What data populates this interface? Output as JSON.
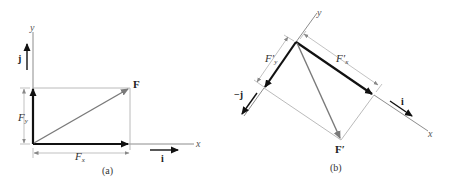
{
  "figure_a": {
    "caption": "(a)",
    "axis_x_label": "x",
    "axis_y_label": "y",
    "force_label": "F",
    "component_x_label": "F",
    "component_x_sub": "x",
    "component_y_label": "F",
    "component_y_sub": "y",
    "unit_i_label": "i",
    "unit_j_label": "j"
  },
  "figure_b": {
    "caption": "(b)",
    "axis_x_label": "x",
    "axis_y_label": "y",
    "force_label": "F′",
    "component_x_label": "F′",
    "component_x_sub": "x",
    "component_y_label": "F′",
    "component_y_sub": "y",
    "unit_i_label": "i",
    "unit_neg_j_label": "−j"
  },
  "colors": {
    "component_arrow": "#111111",
    "resultant_arrow": "#7a7a7a",
    "guide_line": "#a8a8a8",
    "axis_line": "#6e6e6e"
  }
}
